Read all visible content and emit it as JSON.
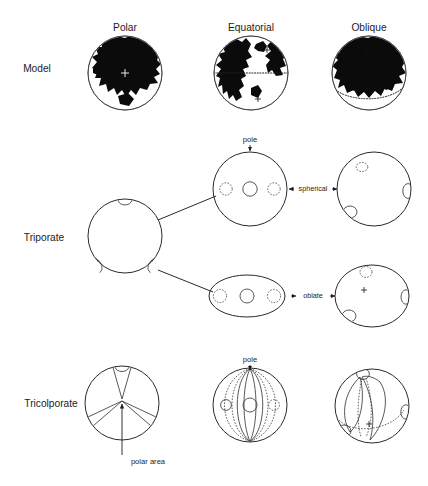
{
  "figure": {
    "background_color": "#ffffff",
    "line_color": "#2a2a2a",
    "land_color": "#0b0b0b"
  },
  "columns": [
    {
      "id": "polar",
      "label": "Polar",
      "x": 125
    },
    {
      "id": "equatorial",
      "label": "Equatorial",
      "x": 251
    },
    {
      "id": "oblique",
      "label": "Oblique",
      "x": 369
    }
  ],
  "rows": [
    {
      "id": "model",
      "label": "Model",
      "x": 37,
      "y": 69
    },
    {
      "id": "triporate",
      "label": "Triporate",
      "x": 44,
      "y": 238
    },
    {
      "id": "tricolporate",
      "label": "Tricolporate",
      "x": 51,
      "y": 404
    }
  ],
  "annotations": {
    "pole_triporate": "pole",
    "pole_tricolporate": "pole",
    "polar_area": "polar area",
    "shape_spherical": "spherical",
    "shape_oblate": "oblate"
  },
  "model_globes": [
    {
      "id": "model-polar",
      "view": "Polar",
      "cx": 125,
      "cy": 73,
      "r": 37,
      "equator": "none"
    },
    {
      "id": "model-equatorial",
      "view": "Equatorial",
      "cx": 251,
      "cy": 73,
      "r": 37,
      "equator": "horizontal-dotted"
    },
    {
      "id": "model-oblique",
      "view": "Oblique",
      "cx": 369,
      "cy": 73,
      "r": 37,
      "equator": "tilted-dotted"
    }
  ],
  "triporate": {
    "polar_view": {
      "cx": 125,
      "cy": 236,
      "r": 37,
      "pores": 3,
      "pore_positions": [
        "top",
        "lower-left",
        "lower-right"
      ]
    },
    "equatorial_spherical": {
      "cx": 250,
      "cy": 189,
      "r": 37,
      "pores": 3,
      "pore_center_solid": 1,
      "pore_side_dashed": 2
    },
    "equatorial_oblate": {
      "cx": 247,
      "cy": 296,
      "rx": 38,
      "ry": 21,
      "pores": 3,
      "pore_center_solid": 1,
      "pore_side_dashed": 2
    },
    "oblique_spherical": {
      "cx": 374,
      "cy": 189,
      "r": 37,
      "pores": 3
    },
    "oblique_oblate": {
      "cx": 372,
      "cy": 296,
      "rx": 37,
      "ry": 31,
      "pores": 3
    }
  },
  "tricolporate": {
    "polar_view": {
      "cx": 122,
      "cy": 403,
      "r": 37,
      "colpi": 3,
      "pores": 3
    },
    "equatorial_view": {
      "cx": 250,
      "cy": 405,
      "r": 37,
      "colpi": 3,
      "pores": 3
    },
    "oblique_view": {
      "cx": 372,
      "cy": 406,
      "r": 37,
      "colpi": 3,
      "pores": 3
    }
  }
}
